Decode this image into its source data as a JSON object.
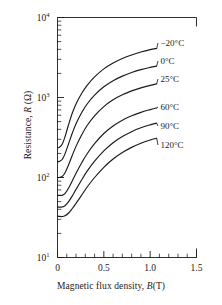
{
  "chart_data": {
    "type": "line",
    "title": "",
    "xlabel": "Magnetic flux density, B(T)",
    "xlabel_parts": {
      "prefix": "Magnetic flux density, ",
      "symbol": "B",
      "suffix": "(T)"
    },
    "ylabel": "Resistance, R (Ω)",
    "ylabel_parts": {
      "prefix": "Resistance, ",
      "symbol": "R",
      "suffix": " (Ω)"
    },
    "xscale": "linear",
    "yscale": "log",
    "xlim": [
      0,
      1.5
    ],
    "ylim": [
      10,
      10000
    ],
    "grid": false,
    "legend_position": "inline-right-of-curve-ends",
    "xticks": [
      0,
      0.5,
      1.0,
      1.5
    ],
    "xticklabels": [
      "0",
      "0.5",
      "1.0",
      "1.5"
    ],
    "xminor_tick_interval": 0.1,
    "yticks": [
      10,
      100,
      1000,
      10000
    ],
    "yticklabels": [
      "10¹",
      "10²",
      "10³",
      "10⁴"
    ],
    "ytick_label_parts": [
      {
        "base": "10",
        "exp": "1"
      },
      {
        "base": "10",
        "exp": "2"
      },
      {
        "base": "10",
        "exp": "3"
      },
      {
        "base": "10",
        "exp": "4"
      }
    ],
    "line_color": "#1a1a1a",
    "series": [
      {
        "name": "−20°C",
        "label": "−20°C",
        "x": [
          0,
          0.02,
          0.05,
          0.08,
          0.12,
          0.16,
          0.2,
          0.26,
          0.32,
          0.4,
          0.5,
          0.6,
          0.7,
          0.8,
          0.9,
          1.0,
          1.07
        ],
        "values": [
          235,
          238,
          260,
          320,
          460,
          640,
          830,
          1120,
          1420,
          1810,
          2280,
          2700,
          3070,
          3400,
          3700,
          3960,
          4100
        ]
      },
      {
        "name": "0°C",
        "label": "0°C",
        "x": [
          0,
          0.02,
          0.05,
          0.08,
          0.12,
          0.16,
          0.2,
          0.26,
          0.32,
          0.4,
          0.5,
          0.6,
          0.7,
          0.8,
          0.9,
          1.0,
          1.07
        ],
        "values": [
          158,
          159,
          168,
          196,
          265,
          360,
          470,
          645,
          830,
          1070,
          1360,
          1620,
          1850,
          2050,
          2230,
          2380,
          2470
        ]
      },
      {
        "name": "25°C",
        "label": "25°C",
        "x": [
          0,
          0.02,
          0.05,
          0.08,
          0.12,
          0.16,
          0.2,
          0.26,
          0.32,
          0.4,
          0.5,
          0.6,
          0.7,
          0.8,
          0.9,
          1.0,
          1.07
        ],
        "values": [
          100,
          100,
          103,
          114,
          144,
          190,
          245,
          340,
          447,
          590,
          770,
          935,
          1080,
          1210,
          1320,
          1420,
          1480
        ]
      },
      {
        "name": "60°C",
        "label": "60°C",
        "x": [
          0,
          0.02,
          0.05,
          0.08,
          0.12,
          0.16,
          0.2,
          0.26,
          0.32,
          0.4,
          0.5,
          0.6,
          0.7,
          0.8,
          0.9,
          1.0,
          1.07
        ],
        "values": [
          60,
          59.5,
          60,
          63,
          74,
          91,
          113,
          152,
          198,
          265,
          355,
          440,
          520,
          590,
          652,
          705,
          740
        ]
      },
      {
        "name": "90°C",
        "label": "90°C",
        "x": [
          0,
          0.02,
          0.05,
          0.08,
          0.12,
          0.16,
          0.2,
          0.26,
          0.32,
          0.4,
          0.5,
          0.6,
          0.7,
          0.8,
          0.9,
          1.0,
          1.07
        ],
        "values": [
          43,
          42.6,
          42.8,
          44.4,
          50,
          59,
          71,
          93,
          120,
          160,
          215,
          272,
          325,
          374,
          418,
          455,
          478
        ]
      },
      {
        "name": "120°C",
        "label": "120°C",
        "x": [
          0,
          0.02,
          0.05,
          0.08,
          0.12,
          0.16,
          0.2,
          0.26,
          0.32,
          0.4,
          0.5,
          0.6,
          0.7,
          0.8,
          0.9,
          1.0,
          1.07
        ],
        "values": [
          33,
          32.6,
          32.5,
          33.2,
          36,
          41,
          47.5,
          60,
          76,
          100,
          134,
          170,
          205,
          238,
          268,
          294,
          310
        ]
      }
    ]
  }
}
